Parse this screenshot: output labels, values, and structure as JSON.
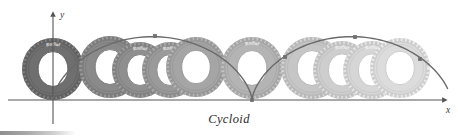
{
  "figure": {
    "caption": "Cycloid",
    "axes": {
      "x_label": "x",
      "y_label": "y",
      "x_axis_color": "#555555",
      "y_axis_color": "#555555",
      "origin": {
        "x": 53,
        "y": 100
      }
    },
    "curve": {
      "name": "cycloid-curve",
      "color": "#6b6b6b",
      "marker_color": "#6f6f6f",
      "cusps": [
        {
          "x": 53,
          "y": 100
        },
        {
          "x": 252,
          "y": 100
        }
      ],
      "markers": [
        {
          "x": 155,
          "y": 36
        },
        {
          "x": 252,
          "y": 100
        },
        {
          "x": 285,
          "y": 57
        },
        {
          "x": 355,
          "y": 37
        },
        {
          "x": 420,
          "y": 59
        }
      ],
      "arch_peaks": [
        {
          "x": 152,
          "y": 35
        },
        {
          "x": 352,
          "y": 36
        }
      ]
    },
    "wheels": [
      {
        "name": "wheel-1",
        "cx": 53,
        "cy": 69,
        "r": 31,
        "tone": "#6f6f6f",
        "inner": "#ffffff",
        "label": "Radial"
      },
      {
        "name": "wheel-2",
        "cx": 110,
        "cy": 67,
        "r": 31,
        "tone": "#8a8a8a",
        "inner": "#ffffff",
        "label": ""
      },
      {
        "name": "wheel-3",
        "cx": 140,
        "cy": 70,
        "r": 28,
        "tone": "#8f8f8f",
        "inner": "#ffffff",
        "label": "Radial"
      },
      {
        "name": "wheel-4",
        "cx": 170,
        "cy": 70,
        "r": 28,
        "tone": "#9a9a9a",
        "inner": "#ffffff",
        "label": "Radial"
      },
      {
        "name": "wheel-5",
        "cx": 196,
        "cy": 67,
        "r": 30,
        "tone": "#a5a5a5",
        "inner": "#ffffff",
        "label": ""
      },
      {
        "name": "wheel-6",
        "cx": 252,
        "cy": 68,
        "r": 31,
        "tone": "#b4b4b4",
        "inner": "#ffffff",
        "label": "Radial"
      },
      {
        "name": "wheel-7",
        "cx": 312,
        "cy": 68,
        "r": 31,
        "tone": "#c6c6c6",
        "inner": "#ffffff",
        "label": ""
      },
      {
        "name": "wheel-8",
        "cx": 342,
        "cy": 70,
        "r": 29,
        "tone": "#cecece",
        "inner": "#ffffff",
        "label": "Radial"
      },
      {
        "name": "wheel-9",
        "cx": 372,
        "cy": 70,
        "r": 29,
        "tone": "#d6d6d6",
        "inner": "#ffffff",
        "label": "Radial"
      },
      {
        "name": "wheel-10",
        "cx": 400,
        "cy": 68,
        "r": 30,
        "tone": "#dcdcdc",
        "inner": "#ffffff",
        "label": ""
      }
    ],
    "bottom_bar": {
      "name": "bottom-gradient-bar",
      "start_color": "#8e8e8e",
      "end_color": "#ffffff"
    }
  }
}
